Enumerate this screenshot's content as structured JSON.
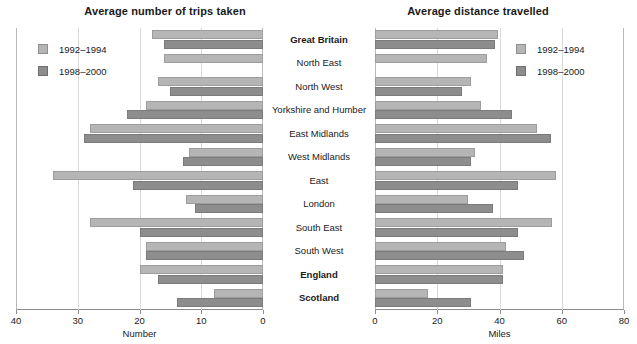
{
  "chart_data": [
    {
      "type": "bar",
      "orientation": "horizontal-reversed",
      "title": "Average number of trips taken",
      "xlabel": "Number",
      "ylabel": "",
      "xlim": [
        40,
        0
      ],
      "xticks": [
        40,
        30,
        20,
        10,
        0
      ],
      "grid": true,
      "legend_position": "top-left",
      "categories": [
        "Great Britain",
        "North East",
        "North West",
        "Yorkshire and Humber",
        "East Midlands",
        "West Midlands",
        "East",
        "London",
        "South East",
        "South West",
        "England",
        "Scotland"
      ],
      "series": [
        {
          "name": "1992–1994",
          "color": "#b5b5b5",
          "values": [
            18,
            16,
            17,
            19,
            28,
            12,
            34,
            12.5,
            28,
            19,
            20,
            8
          ]
        },
        {
          "name": "1998–2000",
          "color": "#8d8d8d",
          "values": [
            16,
            0,
            15,
            22,
            29,
            13,
            21,
            11,
            20,
            19,
            17,
            14
          ]
        }
      ]
    },
    {
      "type": "bar",
      "orientation": "horizontal",
      "title": "Average distance travelled",
      "xlabel": "Miles",
      "ylabel": "",
      "xlim": [
        0,
        80
      ],
      "xticks": [
        0,
        20,
        40,
        60,
        80
      ],
      "grid": true,
      "legend_position": "top-right",
      "categories": [
        "Great Britain",
        "North East",
        "North West",
        "Yorkshire and Humber",
        "East Midlands",
        "West Midlands",
        "East",
        "London",
        "South East",
        "South West",
        "England",
        "Scotland"
      ],
      "series": [
        {
          "name": "1992–1994",
          "color": "#b5b5b5",
          "values": [
            39.5,
            36,
            31,
            34,
            52,
            32,
            58,
            30,
            57,
            42,
            41,
            17
          ]
        },
        {
          "name": "1998–2000",
          "color": "#8d8d8d",
          "values": [
            38.5,
            0,
            28,
            44,
            56.5,
            31,
            46,
            38,
            46,
            48,
            41,
            31
          ]
        }
      ]
    }
  ],
  "left": {
    "title": "Average number of trips taken",
    "axis_label": "Number",
    "ticks": [
      "40",
      "30",
      "20",
      "10",
      "0"
    ],
    "legend": [
      {
        "label": "1992–1994",
        "swatch": "light"
      },
      {
        "label": "1998–2000",
        "swatch": "dark"
      }
    ]
  },
  "right": {
    "title": "Average distance travelled",
    "axis_label": "Miles",
    "ticks": [
      "0",
      "20",
      "40",
      "60",
      "80"
    ],
    "legend": [
      {
        "label": "1992–1994",
        "swatch": "light"
      },
      {
        "label": "1998–2000",
        "swatch": "dark"
      }
    ]
  },
  "categories": [
    {
      "label": "Great Britain",
      "bold": true
    },
    {
      "label": "North East",
      "bold": false
    },
    {
      "label": "North West",
      "bold": false
    },
    {
      "label": "Yorkshire and Humber",
      "bold": false
    },
    {
      "label": "East Midlands",
      "bold": false
    },
    {
      "label": "West Midlands",
      "bold": false
    },
    {
      "label": "East",
      "bold": false
    },
    {
      "label": "London",
      "bold": false
    },
    {
      "label": "South East",
      "bold": false
    },
    {
      "label": "South West",
      "bold": false
    },
    {
      "label": "England",
      "bold": true
    },
    {
      "label": "Scotland",
      "bold": true
    }
  ],
  "colors": {
    "series_1992": "#b5b5b5",
    "series_1998": "#8d8d8d",
    "grid": "#d9d9d9",
    "axis": "#8c8c8c",
    "text": "#1a1a1a",
    "background": "#ffffff"
  }
}
